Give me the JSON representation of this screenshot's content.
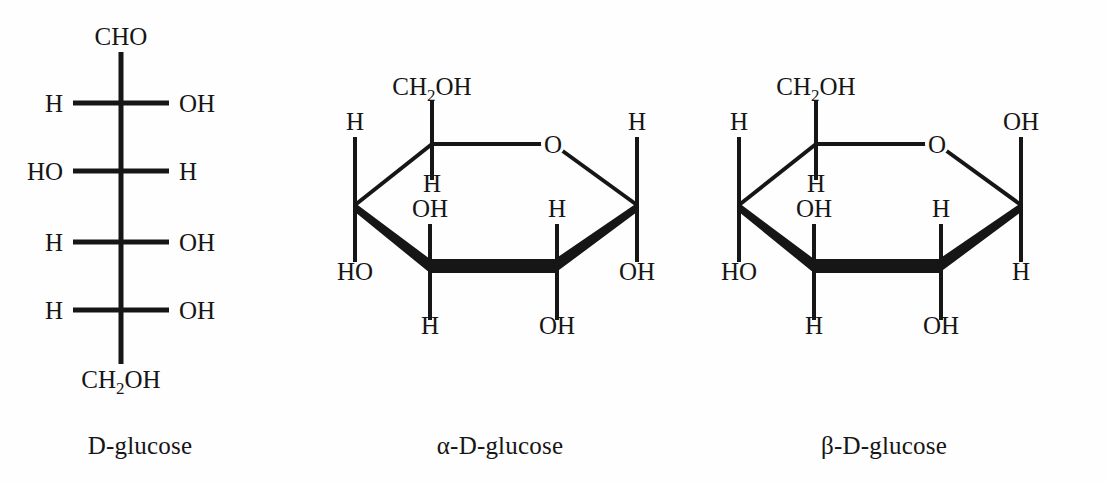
{
  "page": {
    "background_color": "#fefefe",
    "ink_color": "#161616",
    "width": 1109,
    "height": 484
  },
  "structures": [
    {
      "id": "d-glucose-fischer",
      "caption": "D-glucose",
      "projection": "fischer",
      "top_group": "CHO",
      "bottom_group": "CH2OH",
      "bottom_group_parts": {
        "pre": "CH",
        "sub": "2",
        "post": "OH"
      },
      "stereocenters": [
        {
          "index": 1,
          "left": "H",
          "right": "OH"
        },
        {
          "index": 2,
          "left": "HO",
          "right": "H"
        },
        {
          "index": 3,
          "left": "H",
          "right": "OH"
        },
        {
          "index": 4,
          "left": "H",
          "right": "OH"
        }
      ]
    },
    {
      "id": "alpha-d-glucose-haworth",
      "caption": "α-D-glucose",
      "projection": "haworth",
      "ring_oxygen": "O",
      "c5_substituent": {
        "pre": "CH",
        "sub": "2",
        "post": "OH"
      },
      "substituents": {
        "c5_down": "H",
        "c4_up": "H",
        "c4_down": "HO",
        "c3_up": "OH",
        "c3_down": "H",
        "c2_up": "H",
        "c2_down": "OH",
        "c1_up": "H",
        "c1_down": "OH"
      }
    },
    {
      "id": "beta-d-glucose-haworth",
      "caption": "β-D-glucose",
      "projection": "haworth",
      "ring_oxygen": "O",
      "c5_substituent": {
        "pre": "CH",
        "sub": "2",
        "post": "OH"
      },
      "substituents": {
        "c5_down": "H",
        "c4_up": "H",
        "c4_down": "HO",
        "c3_up": "OH",
        "c3_down": "H",
        "c2_up": "H",
        "c2_down": "OH",
        "c1_up": "OH",
        "c1_down": "H"
      }
    }
  ]
}
